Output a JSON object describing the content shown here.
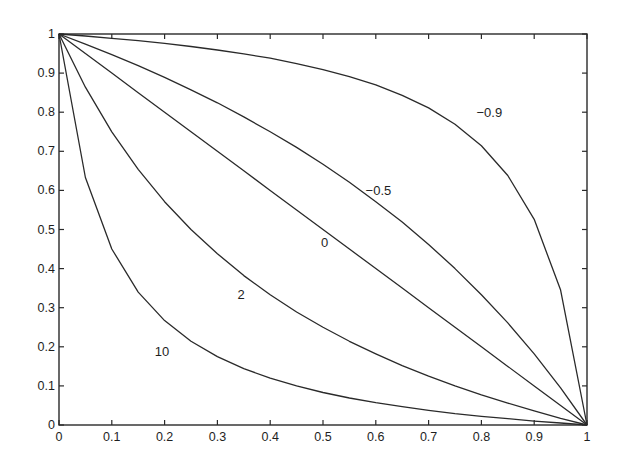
{
  "chart_data": {
    "type": "line",
    "title": "",
    "xlabel": "",
    "ylabel": "",
    "xlim": [
      0,
      1
    ],
    "ylim": [
      0,
      1
    ],
    "grid": false,
    "legend": "none (inline curve labels)",
    "x_ticks": [
      "0",
      "0.1",
      "0.2",
      "0.3",
      "0.4",
      "0.5",
      "0.6",
      "0.7",
      "0.8",
      "0.9",
      "1"
    ],
    "y_ticks": [
      "0",
      "0.1",
      "0.2",
      "0.3",
      "0.4",
      "0.5",
      "0.6",
      "0.7",
      "0.8",
      "0.9",
      "1"
    ],
    "x": [
      0,
      0.05,
      0.1,
      0.15,
      0.2,
      0.25,
      0.3,
      0.35,
      0.4,
      0.45,
      0.5,
      0.55,
      0.6,
      0.65,
      0.7,
      0.75,
      0.8,
      0.85,
      0.9,
      0.95,
      1
    ],
    "series": [
      {
        "name": "-0.9",
        "label": "−0.9",
        "label_pos": [
          0.815,
          0.8
        ],
        "values": [
          1,
          0.995,
          0.989,
          0.983,
          0.976,
          0.968,
          0.959,
          0.949,
          0.938,
          0.924,
          0.909,
          0.891,
          0.87,
          0.843,
          0.811,
          0.769,
          0.714,
          0.638,
          0.526,
          0.345,
          0
        ]
      },
      {
        "name": "-0.5",
        "label": "−0.5",
        "label_pos": [
          0.605,
          0.602
        ],
        "values": [
          1,
          0.974,
          0.947,
          0.919,
          0.889,
          0.857,
          0.824,
          0.788,
          0.75,
          0.71,
          0.667,
          0.621,
          0.571,
          0.519,
          0.462,
          0.4,
          0.333,
          0.261,
          0.182,
          0.095,
          0
        ]
      },
      {
        "name": "0",
        "label": "0",
        "label_pos": [
          0.503,
          0.468
        ],
        "values": [
          1,
          0.95,
          0.9,
          0.85,
          0.8,
          0.75,
          0.7,
          0.65,
          0.6,
          0.55,
          0.5,
          0.45,
          0.4,
          0.35,
          0.3,
          0.25,
          0.2,
          0.15,
          0.1,
          0.05,
          0
        ]
      },
      {
        "name": "2",
        "label": "2",
        "label_pos": [
          0.345,
          0.336
        ],
        "values": [
          1,
          0.864,
          0.75,
          0.654,
          0.571,
          0.5,
          0.438,
          0.382,
          0.333,
          0.289,
          0.25,
          0.214,
          0.182,
          0.152,
          0.125,
          0.1,
          0.077,
          0.056,
          0.036,
          0.017,
          0
        ]
      },
      {
        "name": "10",
        "label": "10",
        "label_pos": [
          0.195,
          0.188
        ],
        "values": [
          1,
          0.633,
          0.45,
          0.34,
          0.267,
          0.214,
          0.175,
          0.144,
          0.12,
          0.1,
          0.083,
          0.069,
          0.057,
          0.047,
          0.0375,
          0.029,
          0.022,
          0.016,
          0.01,
          0.005,
          0
        ]
      }
    ]
  },
  "axes": {
    "x_tick_labels": [
      "0",
      "0.1",
      "0.2",
      "0.3",
      "0.4",
      "0.5",
      "0.6",
      "0.7",
      "0.8",
      "0.9",
      "1"
    ],
    "y_tick_labels": [
      "0",
      "0.1",
      "0.2",
      "0.3",
      "0.4",
      "0.5",
      "0.6",
      "0.7",
      "0.8",
      "0.9",
      "1"
    ]
  },
  "colors": {
    "line": "#2a2a2a",
    "background": "#ffffff",
    "text": "#1e1e1e"
  }
}
